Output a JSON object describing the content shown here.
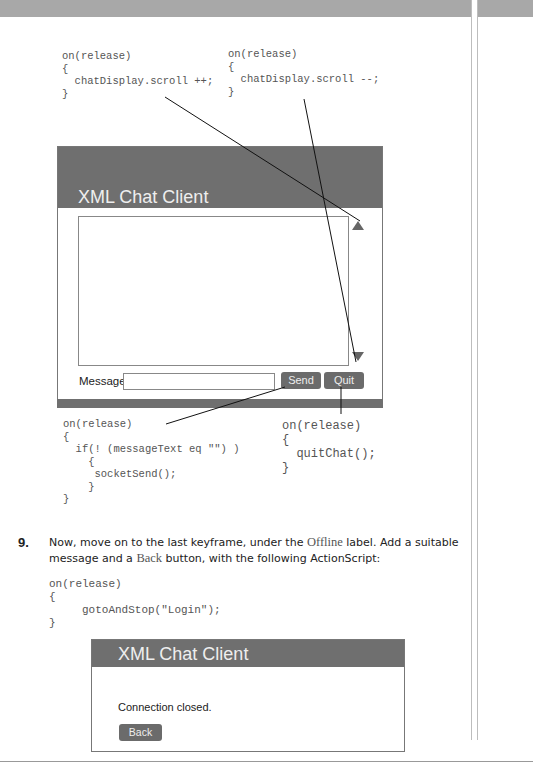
{
  "code_blocks": {
    "scroll_down": [
      "on(release)",
      "{",
      "  chatDisplay.scroll ++;",
      "}"
    ],
    "scroll_up": [
      "on(release)",
      "{",
      "  chatDisplay.scroll --;",
      "}"
    ],
    "send": [
      "on(release)",
      "{",
      "  if(! (messageText eq \"\") )",
      "    {",
      "     socketSend();",
      "    }",
      "}"
    ],
    "quit": [
      "on(release)",
      "{",
      "  quitChat();",
      "}"
    ],
    "back": [
      "on(release)",
      "{",
      "     gotoAndStop(\"Login\");",
      "}"
    ]
  },
  "chat_window": {
    "title": "XML Chat Client",
    "message_label": "Message:",
    "message_value": "",
    "send_label": "Send",
    "quit_label": "Quit",
    "scroll_up_icon": "triangle-up",
    "scroll_down_icon": "triangle-down"
  },
  "step": {
    "number": "9.",
    "text_parts": {
      "p1": "Now, move on to the last keyframe, under the ",
      "term1": "Offline",
      "p2": " label. Add a suitable message and a ",
      "term2": "Back",
      "p3": " button, with the following ActionScript:"
    }
  },
  "offline_window": {
    "title": "XML Chat Client",
    "message": "Connection closed.",
    "back_label": "Back"
  }
}
